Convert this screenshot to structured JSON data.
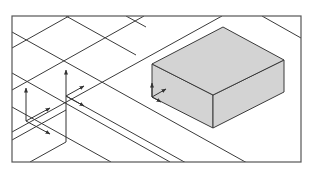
{
  "figure": {
    "colors": {
      "background": "#ffffff",
      "line": "#3a3a3a",
      "frame": "#555555",
      "box_fill": "#d3d3d3"
    },
    "frame": {
      "x": 12,
      "y": 16,
      "width": 289,
      "height": 146
    },
    "grid_lines": [
      {
        "x1": 12,
        "y1": 32,
        "x2": 301,
        "y2": 193
      },
      {
        "x1": 12,
        "y1": 73,
        "x2": 170,
        "y2": 162
      },
      {
        "x1": 12,
        "y1": 107,
        "x2": 111,
        "y2": 162
      },
      {
        "x1": 66,
        "y1": 96,
        "x2": 301,
        "y2": 227
      },
      {
        "x1": 12,
        "y1": 48,
        "x2": 69,
        "y2": 16
      },
      {
        "x1": 12,
        "y1": 90,
        "x2": 144,
        "y2": 16
      },
      {
        "x1": 12,
        "y1": 132,
        "x2": 222,
        "y2": 16
      },
      {
        "x1": 30,
        "y1": 162,
        "x2": 66,
        "y2": 142
      },
      {
        "x1": 66,
        "y1": 16,
        "x2": 136,
        "y2": 55
      },
      {
        "x1": 126,
        "y1": 16,
        "x2": 146,
        "y2": 27
      },
      {
        "x1": 262,
        "y1": 16,
        "x2": 301,
        "y2": 38
      },
      {
        "x1": 12,
        "y1": 140,
        "x2": 66,
        "y2": 110
      }
    ],
    "box": {
      "top": [
        [
          152,
          64
        ],
        [
          223,
          27
        ],
        [
          284,
          60
        ],
        [
          213,
          95
        ]
      ],
      "left": [
        [
          152,
          64
        ],
        [
          213,
          95
        ],
        [
          213,
          128
        ],
        [
          152,
          97
        ]
      ],
      "right": [
        [
          213,
          95
        ],
        [
          284,
          60
        ],
        [
          284,
          92
        ],
        [
          213,
          128
        ]
      ]
    },
    "axis_arrows": [
      {
        "name": "node-a-z-axis",
        "x1": 66,
        "y1": 142,
        "x2": 66,
        "y2": 70
      },
      {
        "name": "node-b-z-axis",
        "x1": 26,
        "y1": 121,
        "x2": 26,
        "y2": 88
      },
      {
        "name": "node-b-x-axis",
        "x1": 26,
        "y1": 121,
        "x2": 50,
        "y2": 108
      },
      {
        "name": "node-b-y-axis",
        "x1": 26,
        "y1": 121,
        "x2": 50,
        "y2": 134
      },
      {
        "name": "node-a-x-axis",
        "x1": 66,
        "y1": 96,
        "x2": 84,
        "y2": 86
      },
      {
        "name": "node-a-y-axis",
        "x1": 66,
        "y1": 96,
        "x2": 84,
        "y2": 106
      },
      {
        "name": "box-z-axis",
        "x1": 152,
        "y1": 97,
        "x2": 152,
        "y2": 83
      },
      {
        "name": "box-x-axis",
        "x1": 152,
        "y1": 97,
        "x2": 166,
        "y2": 89
      },
      {
        "name": "box-y-axis",
        "x1": 152,
        "y1": 97,
        "x2": 161,
        "y2": 102
      }
    ]
  }
}
